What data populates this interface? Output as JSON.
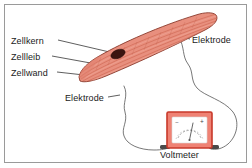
{
  "figure": {
    "border_color": "#9a9a9a",
    "background": "#ffffff"
  },
  "labels": {
    "nucleus": "Zellkern",
    "cell_body": "Zellleib",
    "cell_wall": "Zellwand",
    "electrode_top": "Elektrode",
    "electrode_bottom": "Elektrode",
    "voltmeter": "Voltmeter"
  },
  "cell": {
    "name": "muscle-cell",
    "fill_color": "#e8917f",
    "outline_color": "#8a3a2c",
    "striation_color": "#c9604d",
    "nucleus_color": "#3b1510",
    "highlight_color": "#f3b3a4"
  },
  "voltmeter": {
    "case_color": "#ef8274",
    "case_border": "#c8392a",
    "face_color": "#ffffff",
    "needle_color": "#555555",
    "scale_color": "#8a8a8a",
    "terminal_negative": "−",
    "terminal_positive": "+",
    "terminal_color": "#4a4a4a"
  },
  "wires": {
    "color": "#555555",
    "count": 2
  }
}
